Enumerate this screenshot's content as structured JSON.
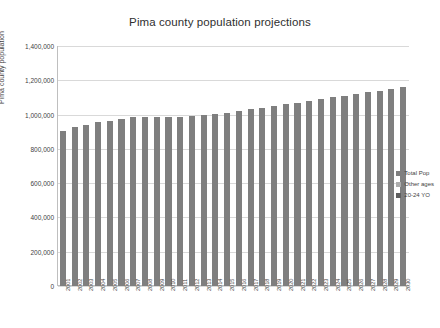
{
  "chart_data": {
    "type": "bar",
    "title": "Pima county population projections",
    "xlabel": "",
    "ylabel": "Pima county population",
    "ylim": [
      0,
      1400000
    ],
    "ytick_labels": [
      "0",
      "200,000",
      "400,000",
      "600,000",
      "800,000",
      "1,000,000",
      "1,200,000",
      "1,400,000"
    ],
    "ytick_values": [
      0,
      200000,
      400000,
      600000,
      800000,
      1000000,
      1200000,
      1400000
    ],
    "grid": true,
    "legend_position": "right",
    "categories": [
      "2001",
      "2002",
      "2003",
      "2004",
      "2005",
      "2006",
      "2007",
      "2008",
      "2009",
      "2010",
      "2011",
      "2012",
      "2013",
      "2014",
      "2015",
      "2016",
      "2017",
      "2018",
      "2019",
      "2020",
      "2021",
      "2022",
      "2023",
      "2024",
      "2025",
      "2026",
      "2027",
      "2028",
      "2029",
      "2030"
    ],
    "series": [
      {
        "name": "Total Pop",
        "color": "#7f7f7f",
        "values": [
          905000,
          925000,
          940000,
          955000,
          965000,
          975000,
          985000,
          985000,
          985000,
          985000,
          985000,
          990000,
          1000000,
          1005000,
          1010000,
          1020000,
          1030000,
          1040000,
          1050000,
          1060000,
          1070000,
          1080000,
          1090000,
          1100000,
          1110000,
          1120000,
          1130000,
          1140000,
          1150000,
          1160000
        ]
      },
      {
        "name": "Other ages",
        "color": "#adadad",
        "values": [
          0,
          0,
          0,
          0,
          0,
          0,
          0,
          0,
          0,
          0,
          0,
          0,
          0,
          0,
          0,
          0,
          0,
          0,
          0,
          0,
          0,
          0,
          0,
          0,
          0,
          0,
          0,
          0,
          0,
          0
        ]
      },
      {
        "name": "20-24 YO",
        "color": "#5f5f5f",
        "values": [
          0,
          0,
          0,
          0,
          0,
          0,
          0,
          0,
          0,
          0,
          0,
          0,
          0,
          0,
          0,
          0,
          0,
          0,
          0,
          0,
          0,
          0,
          0,
          0,
          0,
          0,
          0,
          0,
          0,
          0
        ]
      }
    ]
  }
}
